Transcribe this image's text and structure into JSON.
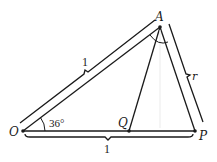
{
  "diagram": {
    "type": "geometry-triangle",
    "points": {
      "O": {
        "label": "O",
        "x": 23,
        "y": 131
      },
      "Q": {
        "label": "Q",
        "x": 129,
        "y": 131
      },
      "P": {
        "label": "P",
        "x": 195,
        "y": 131
      },
      "A": {
        "label": "A",
        "x": 160,
        "y": 27
      }
    },
    "segments": [
      {
        "from": "O",
        "to": "A"
      },
      {
        "from": "A",
        "to": "P"
      },
      {
        "from": "O",
        "to": "P"
      },
      {
        "from": "A",
        "to": "Q"
      }
    ],
    "measures": {
      "OA_length": "1",
      "AP_length": "r",
      "OP_length": "1",
      "angle_O": "36°"
    },
    "colors": {
      "stroke": "#1a1a1a",
      "background": "#ffffff"
    }
  }
}
